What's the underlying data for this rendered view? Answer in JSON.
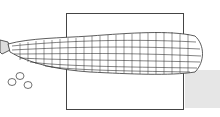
{
  "illustration": {
    "subject": "corn-cob",
    "style": "line-drawing",
    "colors": {
      "line": "#333333",
      "frame": "#444444",
      "shadow": "#e6e6e6",
      "background": "#ffffff"
    },
    "loose_kernels": 3
  }
}
